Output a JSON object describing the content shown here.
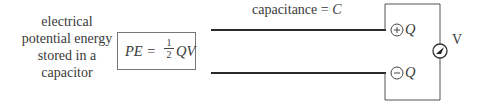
{
  "left_label": {
    "lines": [
      "electrical",
      "potential energy",
      "stored in a",
      "capacitor"
    ]
  },
  "formula": {
    "lhs": "PE =",
    "fraction_numerator": "1",
    "fraction_denominator": "2",
    "rhs": "QV"
  },
  "capacitance_label": {
    "text": "capacitance =",
    "symbol": "C"
  },
  "top_plate": {
    "sign": "+",
    "charge_label": "Q"
  },
  "bottom_plate": {
    "sign": "−",
    "charge_label": "Q"
  },
  "voltmeter": {
    "label": "V"
  },
  "colors": {
    "line": "#2a2a2a",
    "text": "#3a3a3a",
    "box_border": "#777777"
  }
}
